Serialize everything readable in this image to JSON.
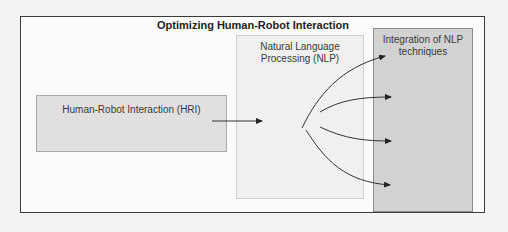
{
  "diagram": {
    "title": "Optimizing Human-Robot Interaction",
    "nodes": [
      {
        "id": "hri",
        "label": "Human-Robot Interaction (HRI)"
      },
      {
        "id": "nlp",
        "label": "Natural Language Processing (NLP)"
      },
      {
        "id": "integration",
        "label": "Integration of NLP techniques"
      }
    ],
    "edges": [
      {
        "from": "hri",
        "to": "nlp"
      },
      {
        "from": "nlp",
        "to": "integration"
      },
      {
        "from": "nlp",
        "to": "integration"
      },
      {
        "from": "nlp",
        "to": "integration"
      },
      {
        "from": "nlp",
        "to": "integration"
      }
    ]
  }
}
